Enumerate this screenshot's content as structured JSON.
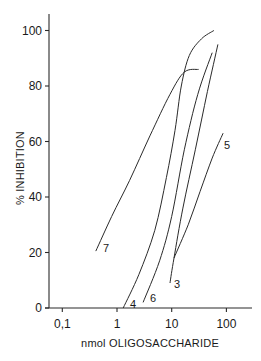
{
  "chart_data": {
    "type": "line",
    "title": "",
    "xlabel": "nmol OLIGOSACCHARIDE",
    "ylabel": "% INHIBITION",
    "xscale": "log",
    "xlim": [
      0.055,
      250
    ],
    "ylim": [
      0,
      105
    ],
    "x_ticks": [
      0.1,
      1,
      10,
      100
    ],
    "x_tick_labels": [
      "0,1",
      "1",
      "10",
      "100"
    ],
    "y_ticks": [
      0,
      20,
      40,
      60,
      80,
      100
    ],
    "y_tick_labels": [
      "0",
      "20",
      "40",
      "60",
      "80",
      "100"
    ],
    "grid": false,
    "legend": "inline curve labels",
    "series": [
      {
        "name": "7",
        "points": [
          [
            0.41,
            20.5
          ],
          [
            0.8,
            33
          ],
          [
            1.7,
            46
          ],
          [
            4.0,
            62
          ],
          [
            9.3,
            77
          ],
          [
            17,
            85
          ],
          [
            31,
            86
          ]
        ]
      },
      {
        "name": "4",
        "points": [
          [
            1.3,
            0
          ],
          [
            2.5,
            12
          ],
          [
            4.9,
            28
          ],
          [
            8.0,
            47
          ],
          [
            11.5,
            64
          ],
          [
            15,
            80
          ],
          [
            21,
            91
          ],
          [
            35,
            97
          ],
          [
            59,
            100
          ]
        ]
      },
      {
        "name": "6",
        "points": [
          [
            3.0,
            2
          ],
          [
            6.0,
            17
          ],
          [
            10,
            33
          ],
          [
            17,
            57
          ],
          [
            30,
            77
          ],
          [
            55,
            92
          ]
        ]
      },
      {
        "name": "3",
        "points": [
          [
            9.3,
            9
          ],
          [
            11,
            18
          ],
          [
            16,
            36
          ],
          [
            27,
            57
          ],
          [
            45,
            78
          ],
          [
            70,
            95
          ]
        ]
      },
      {
        "name": "5",
        "points": [
          [
            11,
            18
          ],
          [
            20,
            30
          ],
          [
            33,
            42
          ],
          [
            55,
            54
          ],
          [
            87,
            63
          ]
        ]
      }
    ],
    "label_positions": {
      "7": {
        "px": 103,
        "py": 252
      },
      "4": {
        "px": 130,
        "py": 308
      },
      "6": {
        "px": 150,
        "py": 302
      },
      "3": {
        "px": 174,
        "py": 288
      },
      "5": {
        "px": 224,
        "py": 149
      }
    }
  },
  "labels": {
    "xlabel": "nmol OLIGOSACCHARIDE",
    "ylabel": "% INHIBITION"
  }
}
